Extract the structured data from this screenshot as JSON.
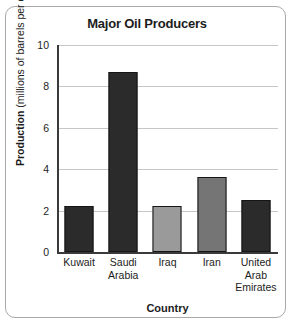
{
  "chart_data": {
    "type": "bar",
    "title": "Major Oil Producers",
    "xlabel": "Country",
    "ylabel": "Production (millions of barrels per day)",
    "ylabel_bold_part": "Production",
    "ylabel_regular_part": " (millions of barrels per day)",
    "categories": [
      "Kuwait",
      "Saudi Arabia",
      "Iraq",
      "Iran",
      "United Arab Emirates"
    ],
    "category_lines": [
      [
        "Kuwait"
      ],
      [
        "Saudi",
        "Arabia"
      ],
      [
        "Iraq"
      ],
      [
        "Iran"
      ],
      [
        "United",
        "Arab",
        "Emirates"
      ]
    ],
    "values": [
      2.2,
      8.7,
      2.2,
      3.6,
      2.5
    ],
    "bar_colors": [
      "#2b2b2b",
      "#2b2b2b",
      "#9a9a9a",
      "#757575",
      "#2b2b2b"
    ],
    "ylim": [
      0,
      10
    ],
    "yticks": [
      0,
      2,
      4,
      6,
      8,
      10
    ],
    "ytick_labels": [
      "0",
      "2",
      "4",
      "6",
      "8",
      "10"
    ],
    "grid": true,
    "legend": "none"
  },
  "frame": {
    "border_color": "#a9a9a9",
    "background": "#ffffff"
  }
}
